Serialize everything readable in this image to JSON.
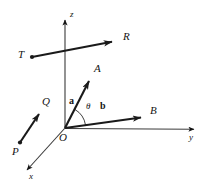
{
  "figure": {
    "type": "vector-diagram",
    "background_color": "#ffffff",
    "stroke_color": "#141414"
  },
  "axes": {
    "x": {
      "label": "x",
      "label_x": 29,
      "label_y": 176,
      "start": [
        65,
        128
      ],
      "end": [
        25,
        172
      ]
    },
    "y": {
      "label": "y",
      "label_x": 189,
      "label_y": 136,
      "start": [
        65,
        128
      ],
      "end": [
        196,
        129
      ]
    },
    "z": {
      "label": "z",
      "label_x": 70,
      "label_y": 10,
      "start": [
        65,
        128
      ],
      "end": [
        65,
        18
      ]
    }
  },
  "origin": {
    "label": "O",
    "label_x": 60,
    "label_y": 136
  },
  "vectors": [
    {
      "name": "vector-a",
      "label": "a",
      "bold": true,
      "label_x": 69,
      "label_y": 99,
      "tip_label": "A",
      "tip_label_x": 95,
      "tip_label_y": 66,
      "from": [
        65,
        128
      ],
      "to": [
        91,
        78
      ]
    },
    {
      "name": "vector-b",
      "label": "b",
      "bold": true,
      "label_x": 100,
      "label_y": 104,
      "tip_label": "B",
      "tip_label_x": 151,
      "tip_label_y": 107,
      "from": [
        65,
        128
      ],
      "to": [
        145,
        117
      ]
    },
    {
      "name": "vector-pq",
      "label": "",
      "bold": false,
      "tail_label": "P",
      "tail_label_x": 12,
      "tail_label_y": 147,
      "tip_label": "Q",
      "tip_label_x": 43,
      "tip_label_y": 98,
      "from": [
        20,
        142
      ],
      "to": [
        41,
        111
      ]
    },
    {
      "name": "vector-tr",
      "label": "",
      "bold": false,
      "tail_label": "T",
      "tail_label_x": 19,
      "tail_label_y": 49,
      "tip_label": "R",
      "tip_label_x": 124,
      "tip_label_y": 31,
      "from": [
        32,
        57
      ],
      "to": [
        116,
        41
      ]
    }
  ],
  "angle": {
    "label": "θ",
    "label_x": 87,
    "label_y": 105,
    "between": [
      "a",
      "b"
    ],
    "vertex": [
      65,
      128
    ]
  }
}
